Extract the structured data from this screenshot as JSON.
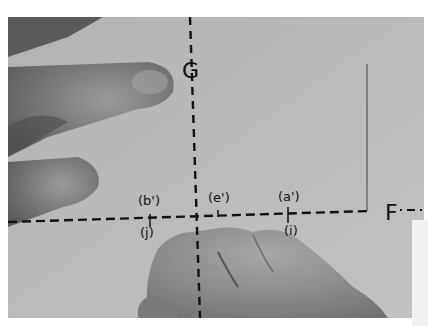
{
  "image": {
    "description": "Grayscale photograph of hands on light fabric with dashed construction lines",
    "background_color": "#b9b9b9"
  },
  "axes": {
    "vertical": {
      "label": "G"
    },
    "horizontal": {
      "label": "F"
    }
  },
  "points": [
    {
      "above": "(b')",
      "below": "(j)"
    },
    {
      "above": "(e')",
      "below": ""
    },
    {
      "above": "(a')",
      "below": "(i)"
    }
  ]
}
